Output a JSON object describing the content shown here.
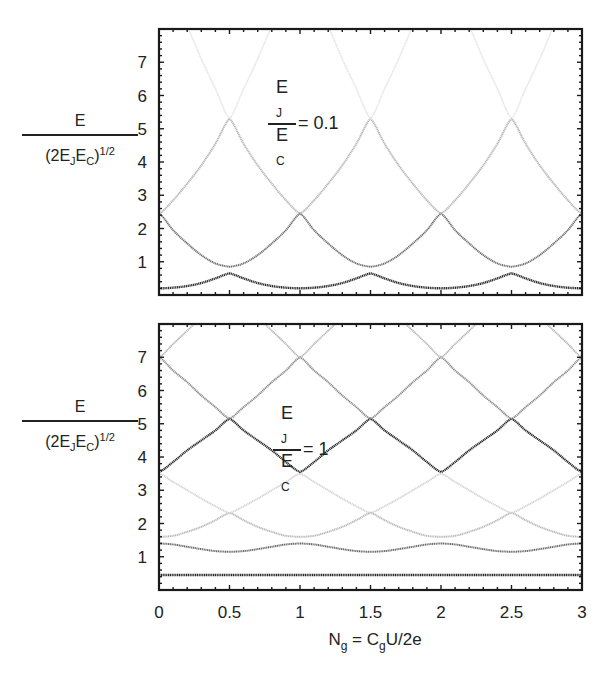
{
  "figure": {
    "top_caption": "",
    "ylabel": {
      "numerator": "E",
      "denominator_prefix": "(2E",
      "sub_j": "J",
      "mid": "E",
      "sub_c": "C",
      "close": ")",
      "exponent": "1/2"
    },
    "xlabel": {
      "n": "N",
      "n_sub": "g",
      "eq": " = C",
      "c_sub": "g",
      "rest": "U/2e"
    }
  },
  "chart_data": [
    {
      "type": "line",
      "title": "E_J/E_C = 0.1",
      "annotation": {
        "numerator": "E",
        "num_sub": "J",
        "denominator": "E",
        "den_sub": "C",
        "value": "= 0.1"
      },
      "xlabel": "N_g = C_gU/2e",
      "ylabel": "E / (2E_J E_C)^(1/2)",
      "xlim": [
        0,
        3
      ],
      "ylim": [
        0,
        8
      ],
      "x_ticks": [
        0,
        0.5,
        1,
        1.5,
        2,
        2.5,
        3
      ],
      "y_ticks": [
        1,
        2,
        3,
        4,
        5,
        6,
        7
      ],
      "y_tick_labels": [
        "1",
        "2",
        "3",
        "4",
        "5",
        "6",
        "7"
      ],
      "grid": false,
      "profile_d": [
        0,
        0.1,
        0.2,
        0.3,
        0.4,
        0.5
      ],
      "profile_note": "values are given vs distance d from nearest integer N_g; curves are periodic with period 1",
      "series": [
        {
          "name": "band 1",
          "color": "#2e2e2e",
          "width": 2.4,
          "values": [
            0.2,
            0.22,
            0.27,
            0.36,
            0.5,
            0.65
          ]
        },
        {
          "name": "band 2",
          "color": "#6e6e6e",
          "width": 2.0,
          "values": [
            2.45,
            1.95,
            1.55,
            1.2,
            0.95,
            0.85
          ]
        },
        {
          "name": "band 3",
          "color": "#b4b4b4",
          "width": 2.0,
          "values": [
            2.45,
            2.85,
            3.35,
            3.9,
            4.55,
            5.3
          ]
        },
        {
          "name": "band 4",
          "color": "#e2e2e2",
          "width": 1.6,
          "values": [
            10.2,
            9.1,
            8.1,
            7.1,
            6.2,
            5.3
          ]
        }
      ]
    },
    {
      "type": "line",
      "title": "E_J/E_C = 1",
      "annotation": {
        "numerator": "E",
        "num_sub": "J",
        "denominator": "E",
        "den_sub": "C",
        "value": "= 1"
      },
      "xlabel": "N_g = C_gU/2e",
      "ylabel": "E / (2E_J E_C)^(1/2)",
      "xlim": [
        0,
        3
      ],
      "ylim": [
        0,
        8
      ],
      "x_ticks": [
        0,
        0.5,
        1,
        1.5,
        2,
        2.5,
        3
      ],
      "x_tick_labels": [
        "0",
        "0.5",
        "1",
        "1.5",
        "2",
        "2.5",
        "3"
      ],
      "y_ticks": [
        1,
        2,
        3,
        4,
        5,
        6,
        7
      ],
      "y_tick_labels": [
        "1",
        "2",
        "3",
        "4",
        "5",
        "6",
        "7"
      ],
      "grid": false,
      "profile_d": [
        0,
        0.1,
        0.2,
        0.3,
        0.4,
        0.5
      ],
      "series": [
        {
          "name": "band 1",
          "color": "#2a2a2a",
          "width": 2.4,
          "values": [
            0.45,
            0.45,
            0.45,
            0.45,
            0.45,
            0.45
          ]
        },
        {
          "name": "band 2",
          "color": "#6a6a6a",
          "width": 2.0,
          "values": [
            1.4,
            1.37,
            1.3,
            1.23,
            1.17,
            1.15
          ]
        },
        {
          "name": "band 3",
          "color": "#b8b8b8",
          "width": 2.0,
          "values": [
            1.6,
            1.63,
            1.75,
            1.9,
            2.1,
            2.32
          ]
        },
        {
          "name": "band 4",
          "color": "#d0d0d0",
          "width": 1.8,
          "values": [
            3.5,
            3.25,
            3.0,
            2.75,
            2.52,
            2.32
          ]
        },
        {
          "name": "band 5",
          "color": "#262626",
          "width": 2.2,
          "values": [
            3.55,
            3.85,
            4.2,
            4.5,
            4.8,
            5.15
          ]
        },
        {
          "name": "band 6",
          "color": "#8a8a8a",
          "width": 2.0,
          "values": [
            7.0,
            6.6,
            6.25,
            5.85,
            5.5,
            5.15
          ]
        },
        {
          "name": "band 7",
          "color": "#b0b0b0",
          "width": 1.8,
          "values": [
            7.0,
            7.4,
            7.8,
            8.2,
            8.6,
            9.0
          ]
        }
      ]
    }
  ]
}
